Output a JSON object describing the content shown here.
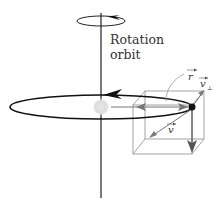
{
  "diagram": {
    "labels": {
      "rotation_line1": "Rotation",
      "rotation_line2": "orbit",
      "r_vector": "r",
      "v_perp_vector": "v",
      "v_perp_subscript": "⊥",
      "v_vector": "v"
    },
    "colors": {
      "axis": "#222222",
      "orbit": "#111111",
      "cube": "#999999",
      "vector_arrow": "#777777",
      "central_body": "#dcdcdc",
      "orbiting_body": "#111111",
      "text": "#333333"
    },
    "icons": {
      "rotation_arrow": "counterclockwise-arrow-icon",
      "orbit_arrow": "left-arrow-icon"
    }
  }
}
